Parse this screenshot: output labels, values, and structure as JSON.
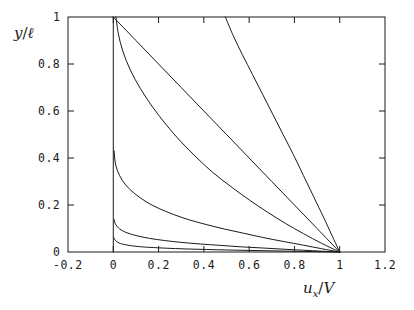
{
  "chart_data": {
    "type": "line",
    "title": "",
    "xlabel": "u_x/V",
    "ylabel": "y/l",
    "xlabel_parts": {
      "main": "u",
      "sub": "x",
      "denom": "V"
    },
    "ylabel_parts": {
      "main": "y",
      "denom": "ℓ"
    },
    "xlim": [
      -0.2,
      1.2
    ],
    "ylim": [
      0,
      1
    ],
    "xticks": [
      -0.2,
      0,
      0.2,
      0.4,
      0.6,
      0.8,
      1,
      1.2
    ],
    "xtick_labels": [
      "-0.2",
      "0",
      "0.2",
      "0.4",
      "0.6",
      "0.8",
      "1",
      "1.2"
    ],
    "yticks": [
      0,
      0.2,
      0.4,
      0.6,
      0.8,
      1
    ],
    "ytick_labels": [
      "0",
      "0.2",
      "0.4",
      "0.6",
      "0.8",
      "1"
    ],
    "grid": false,
    "legend": "none",
    "frame": "box",
    "line_color": "#1a1a1a",
    "line_width": 1.0,
    "background": "#ffffff",
    "series": [
      {
        "name": "curve-1-linear",
        "comment": "straight linear Couette profile from (0,1) to (1,0)",
        "x": [
          0.0,
          0.1,
          0.2,
          0.3,
          0.4,
          0.5,
          0.6,
          0.7,
          0.8,
          0.9,
          1.0
        ],
        "y": [
          1.0,
          0.9,
          0.8,
          0.7,
          0.6,
          0.5,
          0.4,
          0.3,
          0.2,
          0.1,
          0.0
        ]
      },
      {
        "name": "curve-2",
        "comment": "gently concave profile leaving top edge near u=0.5",
        "x": [
          0.495,
          0.53,
          0.57,
          0.615,
          0.66,
          0.705,
          0.75,
          0.795,
          0.84,
          0.885,
          0.93,
          0.965,
          1.0
        ],
        "y": [
          1.0,
          0.92,
          0.84,
          0.755,
          0.67,
          0.585,
          0.5,
          0.415,
          0.325,
          0.235,
          0.145,
          0.072,
          0.0
        ]
      },
      {
        "name": "curve-3",
        "comment": "strongly curved boundary-layer profile, exits top near u=0.03",
        "x": [
          0.012,
          0.022,
          0.042,
          0.075,
          0.12,
          0.175,
          0.235,
          0.3,
          0.37,
          0.44,
          0.52,
          0.6,
          0.68,
          0.76,
          0.84,
          0.92,
          1.0
        ],
        "y": [
          1.0,
          0.93,
          0.855,
          0.775,
          0.695,
          0.615,
          0.54,
          0.468,
          0.4,
          0.338,
          0.278,
          0.222,
          0.17,
          0.122,
          0.078,
          0.037,
          0.0
        ]
      },
      {
        "name": "curve-4",
        "comment": "thin shear layer, knee near y=0.42 at u=0",
        "x": [
          0.004,
          0.006,
          0.012,
          0.028,
          0.055,
          0.095,
          0.145,
          0.2,
          0.265,
          0.335,
          0.41,
          0.49,
          0.575,
          0.66,
          0.75,
          0.84,
          0.92,
          1.0
        ],
        "y": [
          0.43,
          0.4,
          0.365,
          0.325,
          0.285,
          0.248,
          0.214,
          0.186,
          0.16,
          0.137,
          0.117,
          0.098,
          0.08,
          0.062,
          0.045,
          0.029,
          0.014,
          0.0
        ]
      },
      {
        "name": "curve-5",
        "comment": "very thin shear layer, knee near y=0.135 at u=0",
        "x": [
          0.004,
          0.006,
          0.012,
          0.028,
          0.06,
          0.105,
          0.16,
          0.225,
          0.3,
          0.385,
          0.475,
          0.565,
          0.66,
          0.75,
          0.84,
          0.92,
          1.0
        ],
        "y": [
          0.138,
          0.128,
          0.115,
          0.098,
          0.082,
          0.069,
          0.058,
          0.049,
          0.041,
          0.034,
          0.028,
          0.022,
          0.017,
          0.012,
          0.0075,
          0.0035,
          0.0
        ]
      },
      {
        "name": "curve-6",
        "comment": "thinnest shear layer hugging the axis, knee near y=0.058 at u=0",
        "x": [
          0.004,
          0.006,
          0.013,
          0.032,
          0.07,
          0.125,
          0.195,
          0.275,
          0.365,
          0.46,
          0.56,
          0.66,
          0.76,
          0.86,
          0.93,
          1.0
        ],
        "y": [
          0.06,
          0.054,
          0.046,
          0.036,
          0.028,
          0.022,
          0.018,
          0.0145,
          0.0118,
          0.0095,
          0.0075,
          0.0056,
          0.0038,
          0.0021,
          0.001,
          0.0
        ]
      },
      {
        "name": "curve-0-vertical",
        "comment": "near-vertical segment along u=0 from y=0 up to y=1",
        "x": [
          0.0,
          0.0
        ],
        "y": [
          0.0,
          1.0
        ]
      }
    ]
  }
}
